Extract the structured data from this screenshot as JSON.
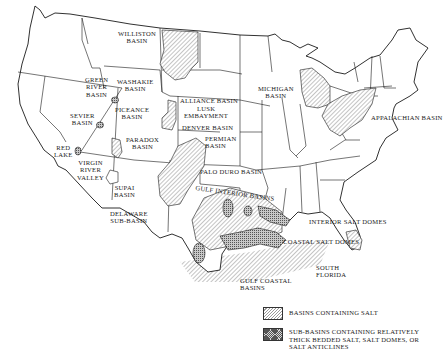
{
  "map": {
    "title": "Salt basins of the United States",
    "region": "Conterminous United States",
    "labels": {
      "williston": "WILLISTON\nBASIN",
      "green_river": "GREEN\nRIVER\nBASIN",
      "washakie": "WASHAKIE\nBASIN",
      "piceance": "PICEANCE\nBASIN",
      "sevier": "SEVIER\nBASIN",
      "paradox": "PARADOX\nBASIN",
      "red_lake": "RED\nLAKE",
      "virgin_river": "VIRGIN\nRIVER\nVALLEY",
      "supai": "SUPAI\nBASIN",
      "delaware": "DELAWARE\nSUB-BASIN",
      "alliance": "ALLIANCE BASIN",
      "lusk": "LUSK\nEMBAYMENT",
      "denver": "DENVER BASIN",
      "permian": "PERMIAN\nBASIN",
      "palo_duro": "PALO DURO BASIN",
      "michigan": "MICHIGAN\nBASIN",
      "appalachian": "APPALACHIAN BASIN",
      "gulf_interior": "GULF INTERIOR BASINS",
      "interior_salt_domes": "INTERIOR SALT DOMES",
      "coastal_salt_domes": "COASTAL SALT DOMES",
      "gulf_coastal": "GULF COASTAL\nBASINS",
      "south_florida": "SOUTH\nFLORIDA"
    }
  },
  "legend": {
    "items": [
      {
        "pattern": "diagonal-hatch",
        "label": "BASINS CONTAINING SALT"
      },
      {
        "pattern": "dense-crosshatch",
        "label": "SUB-BASINS CONTAINING RELATIVELY\nTHICK BEDDED SALT, SALT DOMES, OR\nSALT ANTICLINES"
      }
    ]
  },
  "colors": {
    "background": "#ffffff",
    "line": "#1a1a1a",
    "hatch": "#9a9a9a",
    "dense": "#555555"
  }
}
